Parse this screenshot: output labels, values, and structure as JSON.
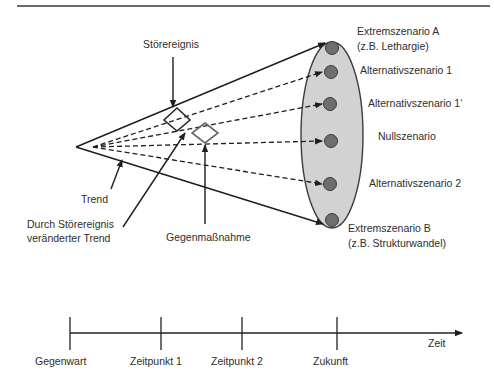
{
  "diagram": {
    "annotations": {
      "stoerereignis": "Störereignis",
      "trend": "Trend",
      "changed_trend_line1": "Durch Störereignis",
      "changed_trend_line2": "veränderter Trend",
      "gegenmassnahme": "Gegenmaßnahme"
    },
    "scenarios": [
      {
        "id": "extreme-a",
        "line1": "Extremszenario A",
        "line2": "(z.B. Lethargie)"
      },
      {
        "id": "alt-1",
        "line1": "Alternativszenario 1"
      },
      {
        "id": "alt-1-prime",
        "line1": "Alternativszenario 1‘"
      },
      {
        "id": "null",
        "line1": "Nullszenario"
      },
      {
        "id": "alt-2",
        "line1": "Alternativszenario 2"
      },
      {
        "id": "extreme-b",
        "line1": "Extremszenario B",
        "line2": "(z.B. Strukturwandel)"
      }
    ],
    "timeline": {
      "axis_label": "Zeit",
      "ticks": [
        "Gegenwart",
        "Zeitpunkt 1",
        "Zeitpunkt 2",
        "Zukunft"
      ]
    },
    "colors": {
      "ellipse_fill": "#d2d2d2",
      "ellipse_stroke": "#3c3c3c",
      "scenario_dot": "#6e6e6e",
      "line": "#1e1e1e",
      "text": "#2e2e2e"
    }
  }
}
